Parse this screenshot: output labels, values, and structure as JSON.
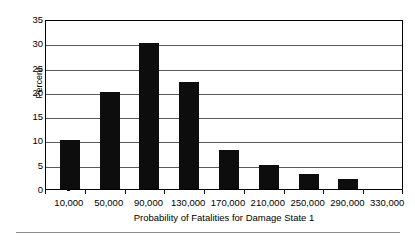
{
  "chart_data": {
    "type": "bar",
    "title": "",
    "subtitle": "",
    "xlabel": "Probability of Fatalities for Damage State 1",
    "ylabel": "Percent",
    "categories": [
      "10,000",
      "50,000",
      "90,000",
      "130,000",
      "170,000",
      "210,000",
      "250,000",
      "290,000"
    ],
    "values": [
      10,
      20,
      30,
      22,
      8,
      5,
      3,
      2
    ],
    "x_tick_labels": [
      "10,000",
      "50,000",
      "90,000",
      "130,000",
      "170,000",
      "210,000",
      "250,000",
      "290,000",
      "330,000"
    ],
    "y_tick_labels": [
      "0",
      "5",
      "10",
      "15",
      "20",
      "25",
      "30",
      "35"
    ],
    "y_tick_values": [
      0,
      5,
      10,
      15,
      20,
      25,
      30,
      35
    ],
    "ylim": [
      0,
      35
    ],
    "grid": "horizontal",
    "legend": "none",
    "bar_color": "#0d0d0d",
    "frame_color": "#000000",
    "gridline_color": "#5a5a5a",
    "background_color": "#ffffff"
  },
  "figure": {
    "bottom_rule_color": "#8c8c8c"
  }
}
